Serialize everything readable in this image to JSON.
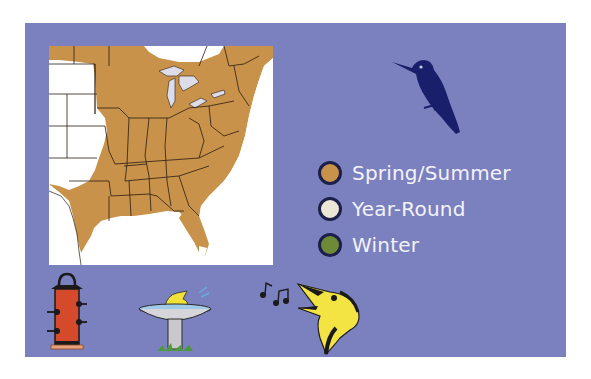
{
  "colors": {
    "panel_bg": "#7b80bf",
    "map_bg": "#ffffff",
    "range_spring_summer": "#c8924a",
    "range_year_round": "#ece6d6",
    "range_winter": "#6f8a36",
    "state_lines": "#2a1c10",
    "lakes": "#dcdde8",
    "hummingbird": "#1a1f6b"
  },
  "map": {
    "name": "range-map",
    "region": "Eastern United States"
  },
  "legend": {
    "items": [
      {
        "label": "Spring/Summer",
        "color": "#c8924a"
      },
      {
        "label": "Year-Round",
        "color": "#ece6d6"
      },
      {
        "label": "Winter",
        "color": "#6f8a36"
      }
    ]
  },
  "icons": {
    "bird": "hummingbird-silhouette-icon",
    "feeder": "tube-feeder-icon",
    "bath": "bird-bath-icon",
    "song": "singing-bird-icon"
  }
}
